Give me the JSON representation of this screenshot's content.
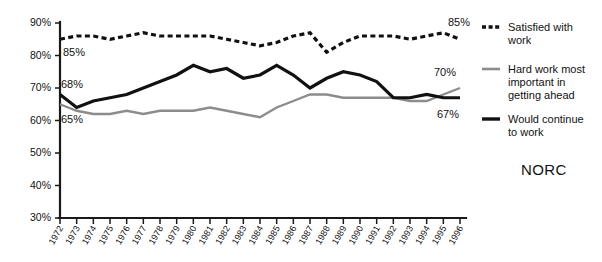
{
  "chart_data": {
    "type": "line",
    "title": "",
    "xlabel": "",
    "ylabel": "",
    "ylim": [
      30,
      90
    ],
    "ytick_labels": [
      "90%",
      "80%",
      "70%",
      "60%",
      "50%",
      "40%",
      "30%"
    ],
    "ytick_values": [
      90,
      80,
      70,
      60,
      50,
      40,
      30
    ],
    "grid": false,
    "legend_position": "right",
    "categories": [
      "1972",
      "1973",
      "1974",
      "1975",
      "1976",
      "1977",
      "1978",
      "1979",
      "1980",
      "1981",
      "1982",
      "1983",
      "1984",
      "1985",
      "1986",
      "1987",
      "1988",
      "1989",
      "1990",
      "1991",
      "1992",
      "1993",
      "1994",
      "1995",
      "1996"
    ],
    "series": [
      {
        "name": "Satisfied with work",
        "style": "dashed",
        "color": "#111111",
        "width": 3.2,
        "values": [
          85,
          86,
          86,
          85,
          86,
          87,
          86,
          86,
          86,
          86,
          85,
          84,
          83,
          84,
          86,
          87,
          81,
          84,
          86,
          86,
          86,
          85,
          86,
          87,
          85
        ]
      },
      {
        "name": "Hard work most important in getting ahead",
        "style": "solid",
        "color": "#8c8c8c",
        "width": 2.4,
        "values": [
          65,
          63,
          62,
          62,
          63,
          62,
          63,
          63,
          63,
          64,
          63,
          62,
          61,
          64,
          66,
          68,
          68,
          67,
          67,
          67,
          67,
          66,
          66,
          68,
          70
        ]
      },
      {
        "name": "Would continue to work",
        "style": "solid",
        "color": "#111111",
        "width": 3.2,
        "values": [
          68,
          64,
          66,
          67,
          68,
          70,
          72,
          74,
          77,
          75,
          76,
          73,
          74,
          77,
          74,
          70,
          73,
          75,
          74,
          72,
          67,
          67,
          68,
          67,
          67
        ]
      }
    ],
    "point_labels": [
      {
        "text": "85%",
        "series": "Satisfied with work",
        "anchor": "start-left",
        "x": 63,
        "y": 56
      },
      {
        "text": "68%",
        "series": "Would continue to work",
        "anchor": "start-left",
        "x": 61,
        "y": 88
      },
      {
        "text": "65%",
        "series": "Hard work most important in getting ahead",
        "anchor": "start-left",
        "x": 61,
        "y": 123
      },
      {
        "text": "85%",
        "series": "Satisfied with work",
        "anchor": "end-right",
        "x": 448,
        "y": 26
      },
      {
        "text": "70%",
        "series": "Hard work most important in getting ahead",
        "anchor": "end-right",
        "x": 434,
        "y": 76
      },
      {
        "text": "67%",
        "series": "Would continue to work",
        "anchor": "end-right",
        "x": 437,
        "y": 118
      }
    ],
    "legend": [
      {
        "label_line1": "Satisfied with",
        "label_line2": "work",
        "label_line3": "",
        "style": "dashed",
        "color": "#111111"
      },
      {
        "label_line1": "Hard work most",
        "label_line2": "important in",
        "label_line3": "getting ahead",
        "style": "solid",
        "color": "#8c8c8c"
      },
      {
        "label_line1": "Would continue",
        "label_line2": "to work",
        "label_line3": "",
        "style": "solid",
        "color": "#111111"
      }
    ],
    "source": "NORC"
  }
}
